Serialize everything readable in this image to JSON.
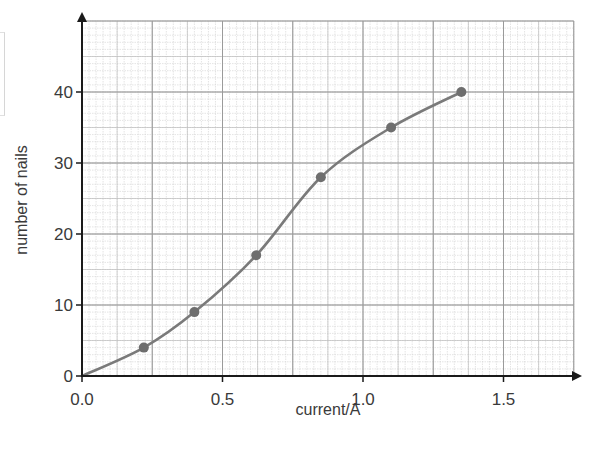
{
  "chart_data": {
    "type": "line",
    "title": "",
    "xlabel": "current/A",
    "ylabel": "number of nails",
    "xlim": [
      0,
      1.75
    ],
    "ylim": [
      0,
      50
    ],
    "x_ticks": [
      0.0,
      0.5,
      1.0,
      1.5
    ],
    "x_tick_labels": [
      "0.0",
      "0.5",
      "1.0",
      "1.5"
    ],
    "y_ticks": [
      0,
      10,
      20,
      30,
      40
    ],
    "y_tick_labels": [
      "0",
      "10",
      "20",
      "30",
      "40"
    ],
    "grid": {
      "on": true,
      "major_x_step": 0.25,
      "major_y_step": 10,
      "minor_x_step": 0.025,
      "minor_y_step": 1
    },
    "legend": null,
    "series": [
      {
        "name": "number of nails vs current",
        "marker": "circle",
        "line": "smooth curve of best fit through origin",
        "color": "#777777",
        "points": [
          {
            "x": 0.22,
            "y": 4
          },
          {
            "x": 0.4,
            "y": 9
          },
          {
            "x": 0.62,
            "y": 17
          },
          {
            "x": 0.85,
            "y": 28
          },
          {
            "x": 1.1,
            "y": 35
          },
          {
            "x": 1.35,
            "y": 40
          }
        ],
        "curve_starts_at": {
          "x": 0.0,
          "y": 0
        }
      }
    ]
  },
  "colors": {
    "axis": "#1a1a1a",
    "major_grid": "#9a9a9a",
    "minor_grid": "#d2d2d2",
    "curve": "#7a7a7a",
    "marker": "#6e6e6e",
    "text": "#3a3a3a"
  },
  "labels": {
    "xlabel": "current/A",
    "ylabel": "number of nails"
  }
}
